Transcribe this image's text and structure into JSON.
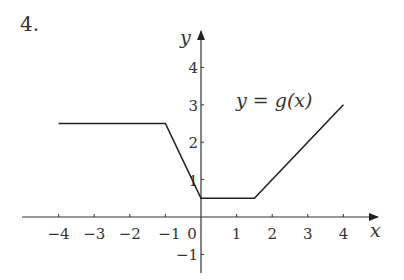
{
  "problem_number": "4.",
  "chart_data": {
    "type": "line",
    "title": "",
    "function_label": "y = g(x)",
    "xlabel": "x",
    "ylabel": "y",
    "xlim": [
      -5,
      5
    ],
    "ylim": [
      -1.5,
      4.7
    ],
    "grid": false,
    "legend": "none",
    "x_ticks": [
      -4,
      -3,
      -2,
      -1,
      0,
      1,
      2,
      3,
      4
    ],
    "x_tick_labels": [
      "−4",
      "−3",
      "−2",
      "−1",
      "0",
      "1",
      "2",
      "3",
      "4"
    ],
    "y_ticks": [
      -1,
      1,
      2,
      3,
      4
    ],
    "y_tick_labels": [
      "−1",
      "1",
      "2",
      "3",
      "4"
    ],
    "series": [
      {
        "name": "g(x)",
        "x": [
          -4,
          -1,
          0,
          1.5,
          4
        ],
        "y": [
          2.5,
          2.5,
          0.5,
          0.5,
          3
        ]
      }
    ]
  }
}
